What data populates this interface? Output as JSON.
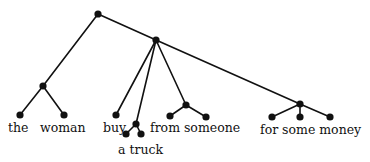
{
  "diagram": {
    "type": "tree",
    "colors": {
      "ink": "#111111",
      "background": "#ffffff"
    },
    "nodes": [
      {
        "id": "root",
        "x": 98,
        "y": 14
      },
      {
        "id": "np",
        "x": 43,
        "y": 86
      },
      {
        "id": "the",
        "x": 20,
        "y": 115
      },
      {
        "id": "woman",
        "x": 64,
        "y": 115
      },
      {
        "id": "vp",
        "x": 156,
        "y": 40
      },
      {
        "id": "buy",
        "x": 116,
        "y": 115
      },
      {
        "id": "obj",
        "x": 136,
        "y": 124
      },
      {
        "id": "a",
        "x": 126,
        "y": 134
      },
      {
        "id": "truck",
        "x": 141,
        "y": 134
      },
      {
        "id": "pp1",
        "x": 186,
        "y": 105
      },
      {
        "id": "from",
        "x": 170,
        "y": 116
      },
      {
        "id": "someone",
        "x": 206,
        "y": 117
      },
      {
        "id": "pp2",
        "x": 300,
        "y": 104
      },
      {
        "id": "for",
        "x": 272,
        "y": 117
      },
      {
        "id": "some",
        "x": 300,
        "y": 117
      },
      {
        "id": "money",
        "x": 330,
        "y": 117
      }
    ],
    "edges": [
      [
        "root",
        "np"
      ],
      [
        "root",
        "vp"
      ],
      [
        "np",
        "the"
      ],
      [
        "np",
        "woman"
      ],
      [
        "vp",
        "buy"
      ],
      [
        "vp",
        "obj"
      ],
      [
        "vp",
        "pp1"
      ],
      [
        "vp",
        "pp2"
      ],
      [
        "obj",
        "a"
      ],
      [
        "obj",
        "truck"
      ],
      [
        "pp1",
        "from"
      ],
      [
        "pp1",
        "someone"
      ],
      [
        "pp2",
        "for"
      ],
      [
        "pp2",
        "some"
      ],
      [
        "pp2",
        "money"
      ]
    ],
    "labels": {
      "the": {
        "text": "the",
        "x": 8,
        "y": 132
      },
      "woman": {
        "text": "woman",
        "x": 40,
        "y": 132
      },
      "buy": {
        "text": "buy",
        "x": 103,
        "y": 132
      },
      "a_truck": {
        "text": "a truck",
        "x": 118,
        "y": 154
      },
      "from_someone": {
        "text": "from someone",
        "x": 150,
        "y": 132
      },
      "for_some_money": {
        "text": "for some money",
        "x": 260,
        "y": 134
      }
    }
  }
}
